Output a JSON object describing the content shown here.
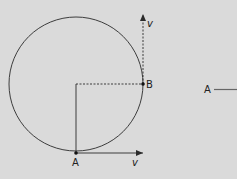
{
  "diagram": {
    "background": "#dadada",
    "stroke_color": "#2a2a2a",
    "circle": {
      "cx": 76,
      "cy": 84,
      "r": 67
    },
    "points": [
      {
        "id": "A",
        "label": "A",
        "x": 76,
        "y": 153
      },
      {
        "id": "B",
        "label": "B",
        "x": 143,
        "y": 84
      }
    ],
    "vectors": [
      {
        "id": "v-at-A",
        "label": "v",
        "style": "solid"
      },
      {
        "id": "v-at-B",
        "label": "v",
        "style": "dashed"
      }
    ],
    "side_label": {
      "label": "A"
    }
  }
}
